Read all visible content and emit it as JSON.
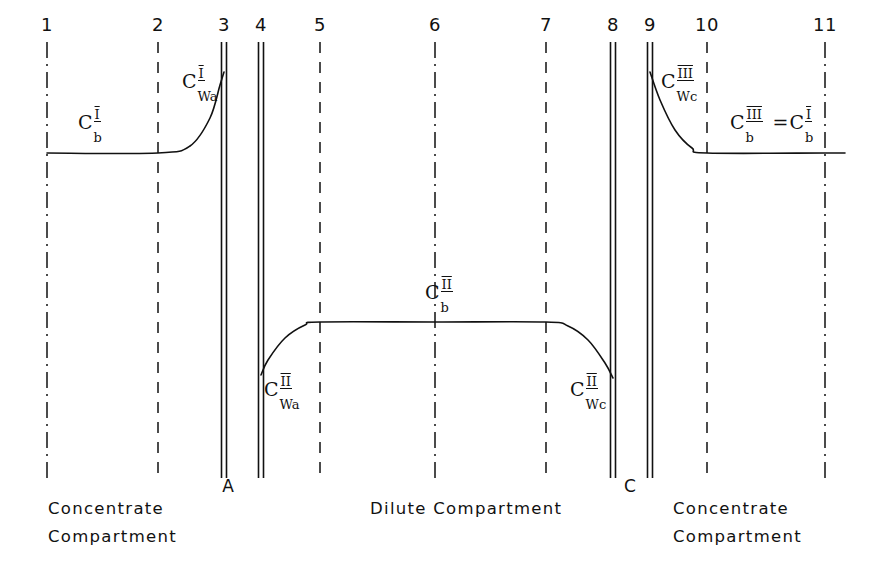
{
  "figure": {
    "background_color": "#ffffff",
    "line_color": "#111111"
  },
  "axis_numbers": [
    {
      "label": "1",
      "x": 47
    },
    {
      "label": "2",
      "x": 158
    },
    {
      "label": "3",
      "x": 224
    },
    {
      "label": "4",
      "x": 261
    },
    {
      "label": "5",
      "x": 320
    },
    {
      "label": "6",
      "x": 435
    },
    {
      "label": "7",
      "x": 546
    },
    {
      "label": "8",
      "x": 613
    },
    {
      "label": "9",
      "x": 650
    },
    {
      "label": "10",
      "x": 707
    },
    {
      "label": "11",
      "x": 825
    }
  ],
  "membrane_letters": [
    {
      "label": "A",
      "x": 228
    },
    {
      "label": "C",
      "x": 630
    }
  ],
  "compartment_labels": [
    {
      "text": "Concentrate\nCompartment",
      "x": 48,
      "y": 495
    },
    {
      "text": "Dilute  Compartment",
      "x": 370,
      "y": 495
    },
    {
      "text": "Concentrate\nCompartment",
      "x": 673,
      "y": 495
    }
  ],
  "concentration_labels": [
    {
      "id": "cb1",
      "base": "C",
      "sup": "I",
      "sub": "b",
      "x": 78,
      "y": 113
    },
    {
      "id": "cwa1",
      "base": "C",
      "sup": "I",
      "sub": "Wa",
      "x": 182,
      "y": 72
    },
    {
      "id": "cwa2",
      "base": "C",
      "sup": "II",
      "sub": "Wa",
      "x": 264,
      "y": 380
    },
    {
      "id": "cb2",
      "base": "C",
      "sup": "II",
      "sub": "b",
      "x": 425,
      "y": 283
    },
    {
      "id": "cwc2",
      "base": "C",
      "sup": "II",
      "sub": "Wc",
      "x": 570,
      "y": 380
    },
    {
      "id": "cwc3",
      "base": "C",
      "sup": "III",
      "sub": "Wc",
      "x": 661,
      "y": 72
    }
  ],
  "equality_label": {
    "left_base": "C",
    "left_sup": "III",
    "left_sub": "b",
    "equals": "=",
    "right_base": "C",
    "right_sup": "I",
    "right_sub": "b",
    "x": 730,
    "y": 113
  },
  "chart_data": {
    "type": "line",
    "xlabel": "",
    "ylabel": "Concentration",
    "grid": false,
    "legend": "none",
    "boundary_positions": {
      "1": 47,
      "2": 158,
      "3": 224,
      "4": 261,
      "5": 320,
      "6": 435,
      "7": 546,
      "8": 613,
      "9": 650,
      "10": 707,
      "11": 825
    },
    "boundary_styles": {
      "1": "dash-dot",
      "2": "dashed",
      "3": "membrane-pair",
      "4": "membrane-pair",
      "5": "dashed",
      "6": "dash-dot",
      "7": "dashed",
      "8": "membrane-pair",
      "9": "membrane-pair",
      "10": "dashed",
      "11": "dash-dot"
    },
    "levels": {
      "concentrate_bulk_y": 153,
      "concentrate_wall_high_y": 72,
      "dilute_bulk_y": 322,
      "dilute_wall_low_y": 375
    },
    "series": [
      {
        "name": "Concentrate Compartment I",
        "description": "Flat bulk concentration C_b^I from boundary 1 to 2, then rises sharply to wall concentration C_Wa^I at membrane A (boundary 3).",
        "points": [
          {
            "x": 47,
            "y": 153
          },
          {
            "x": 158,
            "y": 153
          },
          {
            "x": 190,
            "y": 146
          },
          {
            "x": 210,
            "y": 118
          },
          {
            "x": 220,
            "y": 85
          },
          {
            "x": 224,
            "y": 72
          }
        ]
      },
      {
        "name": "Dilute Compartment II",
        "description": "Rises from low wall concentration C_Wa^II at membrane A (boundary 4) up to bulk C_b^II, flat across boundaries 5 to 7, then falls to wall concentration C_Wc^II at membrane C (boundary 8).",
        "points": [
          {
            "x": 261,
            "y": 375
          },
          {
            "x": 268,
            "y": 360
          },
          {
            "x": 285,
            "y": 338
          },
          {
            "x": 305,
            "y": 325
          },
          {
            "x": 320,
            "y": 322
          },
          {
            "x": 435,
            "y": 322
          },
          {
            "x": 546,
            "y": 322
          },
          {
            "x": 568,
            "y": 326
          },
          {
            "x": 588,
            "y": 340
          },
          {
            "x": 605,
            "y": 363
          },
          {
            "x": 613,
            "y": 378
          }
        ]
      },
      {
        "name": "Concentrate Compartment III",
        "description": "Falls from wall concentration C_Wc^III at membrane C (boundary 9) to bulk concentration C_b^III which equals C_b^I, flat from boundary 10 to 11.",
        "points": [
          {
            "x": 650,
            "y": 72
          },
          {
            "x": 660,
            "y": 100
          },
          {
            "x": 675,
            "y": 130
          },
          {
            "x": 692,
            "y": 148
          },
          {
            "x": 707,
            "y": 153
          },
          {
            "x": 825,
            "y": 153
          },
          {
            "x": 845,
            "y": 153
          }
        ]
      }
    ]
  }
}
